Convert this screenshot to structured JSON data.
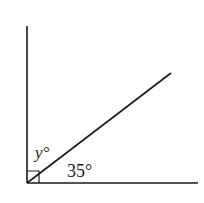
{
  "diagram": {
    "type": "angle-diagram",
    "labels": {
      "upper_angle": "y°",
      "lower_angle": "35°"
    },
    "right_angle_marker": true,
    "geometry": {
      "vertex": [
        27,
        183
      ],
      "vertical_end": [
        27,
        26
      ],
      "horizontal_end": [
        198,
        183
      ],
      "ray_end": [
        171,
        73
      ]
    },
    "line_color": "#1a1a1a"
  }
}
